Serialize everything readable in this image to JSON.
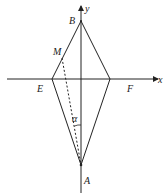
{
  "diagram": {
    "labels": {
      "B": "B",
      "M": "M",
      "E": "E",
      "F": "F",
      "A": "A",
      "x": "x",
      "y": "y",
      "alpha": "α"
    },
    "points": {
      "B": [
        81,
        21
      ],
      "E": [
        52,
        79
      ],
      "F": [
        110,
        79
      ],
      "A": [
        81,
        165
      ],
      "M": [
        62,
        58
      ]
    },
    "colors": {
      "stroke": "#222222",
      "background": "#ffffff"
    }
  }
}
